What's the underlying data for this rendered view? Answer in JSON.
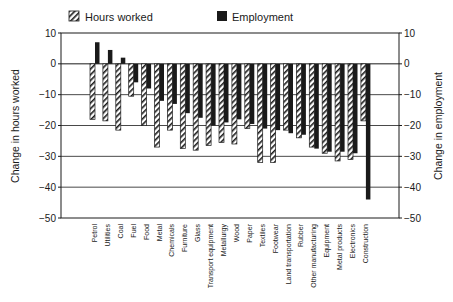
{
  "chart_data": {
    "type": "bar",
    "title": "",
    "xlabel": "",
    "ylabel": "Change in hours worked",
    "ylabel_right": "Change in employment",
    "ylim": [
      -50,
      10
    ],
    "yticks": [
      10,
      0,
      -10,
      -20,
      -30,
      -40,
      -50
    ],
    "grid": true,
    "legend_position": "top",
    "categories": [
      "Petrol",
      "Utilities",
      "Coal",
      "Fuel",
      "Food",
      "Metal",
      "Chemicals",
      "Furniture",
      "Glass",
      "Transport equipment",
      "Metallurgy",
      "Wood",
      "Paper",
      "Textiles",
      "Footwear",
      "Land transportation",
      "Rubber",
      "Other manufacturing",
      "Equipment",
      "Metal products",
      "Electronics",
      "Construction"
    ],
    "series": [
      {
        "name": "Hours worked",
        "pattern": "hatched",
        "values": [
          -18,
          -18.5,
          -21.5,
          -10.5,
          -20,
          -27,
          -21.5,
          -27.5,
          -28,
          -26.5,
          -25.5,
          -26,
          -21,
          -32,
          -32,
          -21.5,
          -24,
          -27,
          -29,
          -31.5,
          -31,
          -18.5
        ]
      },
      {
        "name": "Employment",
        "pattern": "solid",
        "values": [
          7,
          4.5,
          2,
          -6,
          -8,
          -12,
          -13,
          -16,
          -17.5,
          -20,
          -19,
          -18,
          -19.5,
          -21,
          -21.5,
          -22.5,
          -23,
          -27.5,
          -28.5,
          -28.5,
          -29,
          -44
        ]
      }
    ]
  },
  "legend": {
    "hours_label": "Hours worked",
    "employment_label": "Employment"
  },
  "axes": {
    "left_title": "Change in hours worked",
    "right_title": "Change in employment",
    "tick_labels": [
      "10",
      "0",
      "−10",
      "−20",
      "−30",
      "−40",
      "−50"
    ]
  },
  "colors": {
    "ink": "#1a1a1a",
    "background": "#ffffff"
  }
}
